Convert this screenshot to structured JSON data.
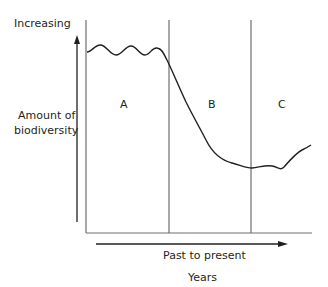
{
  "diagram": {
    "y_axis_top_label": "Increasing",
    "y_axis_label_line1": "Amount of",
    "y_axis_label_line2": "biodiversity",
    "x_axis_arrow_label": "Past to present",
    "x_axis_label": "Years",
    "regions": [
      {
        "label": "A"
      },
      {
        "label": "B"
      },
      {
        "label": "C"
      }
    ],
    "line_color": "#231f20",
    "divider_color": "#6d6e70"
  }
}
